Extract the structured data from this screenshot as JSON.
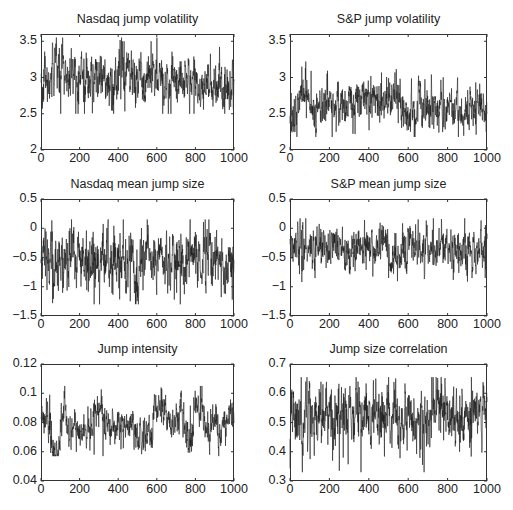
{
  "chart_data": [
    {
      "type": "line",
      "title": "Nasdaq jump volatility",
      "xlabel": "",
      "ylabel": "",
      "xlim": [
        0,
        1000
      ],
      "ylim": [
        2,
        3.6
      ],
      "xticks": [
        0,
        200,
        400,
        600,
        800,
        1000
      ],
      "yticks": [
        2,
        2.5,
        3,
        3.5
      ],
      "ytick_labels": [
        "2",
        "2.5",
        "3",
        "3.5"
      ],
      "grid": false,
      "series": [
        {
          "name": "Nasdaq jump volatility",
          "n": 1000,
          "mean": 2.97,
          "spread": 0.14,
          "min": 2.5,
          "max": 3.55,
          "segments": [
            [
              0,
              50,
              2.9
            ],
            [
              50,
              120,
              3.12
            ],
            [
              120,
              400,
              2.98
            ],
            [
              400,
              460,
              3.1
            ],
            [
              460,
              740,
              2.95
            ],
            [
              740,
              800,
              3.05
            ],
            [
              800,
              1000,
              2.9
            ]
          ],
          "peaks": [
            [
              80,
              3.55
            ],
            [
              410,
              3.5
            ],
            [
              430,
              3.5
            ],
            [
              570,
              3.5
            ],
            [
              630,
              2.5
            ],
            [
              60,
              3.48
            ]
          ]
        }
      ],
      "box": {
        "x": 41,
        "y": 34,
        "w": 193,
        "h": 116
      }
    },
    {
      "type": "line",
      "title": "S&P jump volatility",
      "xlabel": "",
      "ylabel": "",
      "xlim": [
        0,
        1000
      ],
      "ylim": [
        2,
        3.6
      ],
      "xticks": [
        0,
        200,
        400,
        600,
        800,
        1000
      ],
      "yticks": [
        2,
        2.5,
        3,
        3.5
      ],
      "ytick_labels": [
        "2",
        "2.5",
        "3",
        "3.5"
      ],
      "grid": false,
      "series": [
        {
          "name": "S&P jump volatility",
          "n": 1000,
          "mean": 2.62,
          "spread": 0.12,
          "min": 2.18,
          "max": 3.22,
          "segments": [
            [
              0,
              50,
              2.55
            ],
            [
              50,
              100,
              2.78
            ],
            [
              100,
              330,
              2.62
            ],
            [
              330,
              560,
              2.7
            ],
            [
              560,
              650,
              2.5
            ],
            [
              650,
              700,
              2.68
            ],
            [
              700,
              1000,
              2.57
            ]
          ],
          "peaks": [
            [
              80,
              3.22
            ],
            [
              60,
              3.15
            ],
            [
              330,
              2.22
            ],
            [
              630,
              2.18
            ],
            [
              850,
              3.0
            ],
            [
              410,
              3.02
            ]
          ]
        }
      ],
      "box": {
        "x": 290,
        "y": 34,
        "w": 197,
        "h": 116
      }
    },
    {
      "type": "line",
      "title": "Nasdaq mean jump size",
      "xlabel": "",
      "ylabel": "",
      "xlim": [
        0,
        1000
      ],
      "ylim": [
        -1.5,
        0.5
      ],
      "xticks": [
        0,
        200,
        400,
        600,
        800,
        1000
      ],
      "yticks": [
        -1.5,
        -1,
        -0.5,
        0,
        0.5
      ],
      "ytick_labels": [
        "−1.5",
        "−1",
        "−0.5",
        "0",
        "0.5"
      ],
      "grid": false,
      "series": [
        {
          "name": "Nasdaq mean jump size",
          "n": 1000,
          "mean": -0.55,
          "spread": 0.2,
          "min": -1.3,
          "max": 0.15,
          "segments": [
            [
              0,
              480,
              -0.55
            ],
            [
              480,
              540,
              -0.75
            ],
            [
              540,
              600,
              -0.45
            ],
            [
              600,
              840,
              -0.55
            ],
            [
              840,
              880,
              -0.35
            ],
            [
              880,
              1000,
              -0.6
            ]
          ],
          "peaks": [
            [
              60,
              -1.28
            ],
            [
              170,
              -1.2
            ],
            [
              500,
              -1.18
            ],
            [
              690,
              -1.22
            ],
            [
              850,
              0.15
            ],
            [
              990,
              -1.22
            ],
            [
              150,
              0.0
            ],
            [
              170,
              0.02
            ]
          ]
        }
      ],
      "box": {
        "x": 41,
        "y": 199,
        "w": 193,
        "h": 117
      }
    },
    {
      "type": "line",
      "title": "S&P mean jump size",
      "xlabel": "",
      "ylabel": "",
      "xlim": [
        0,
        1000
      ],
      "ylim": [
        -1.5,
        0.5
      ],
      "xticks": [
        0,
        200,
        400,
        600,
        800,
        1000
      ],
      "yticks": [
        -1.5,
        -1,
        -0.5,
        0,
        0.5
      ],
      "ytick_labels": [
        "−1.5",
        "−1",
        "−0.5",
        "0",
        "0.5"
      ],
      "grid": false,
      "series": [
        {
          "name": "S&P mean jump size",
          "n": 1000,
          "mean": -0.33,
          "spread": 0.15,
          "min": -0.92,
          "max": 0.17,
          "segments": [
            [
              0,
              480,
              -0.33
            ],
            [
              480,
              560,
              -0.5
            ],
            [
              560,
              1000,
              -0.32
            ]
          ],
          "peaks": [
            [
              60,
              -0.92
            ],
            [
              80,
              0.17
            ],
            [
              650,
              0.15
            ],
            [
              500,
              -0.85
            ],
            [
              990,
              -0.85
            ]
          ]
        }
      ],
      "box": {
        "x": 290,
        "y": 199,
        "w": 197,
        "h": 117
      }
    },
    {
      "type": "line",
      "title": "Jump intensity",
      "xlabel": "",
      "ylabel": "",
      "xlim": [
        0,
        1000
      ],
      "ylim": [
        0.04,
        0.12
      ],
      "xticks": [
        0,
        200,
        400,
        600,
        800,
        1000
      ],
      "yticks": [
        0.04,
        0.06,
        0.08,
        0.1,
        0.12
      ],
      "ytick_labels": [
        "0.04",
        "0.06",
        "0.08",
        "0.1",
        "0.12"
      ],
      "grid": false,
      "series": [
        {
          "name": "Jump intensity",
          "n": 1000,
          "mean": 0.079,
          "spread": 0.005,
          "min": 0.057,
          "max": 0.105,
          "segments": [
            [
              0,
              50,
              0.083
            ],
            [
              50,
              100,
              0.063
            ],
            [
              100,
              130,
              0.088
            ],
            [
              130,
              270,
              0.075
            ],
            [
              270,
              320,
              0.088
            ],
            [
              320,
              480,
              0.078
            ],
            [
              480,
              560,
              0.07
            ],
            [
              560,
              580,
              0.068
            ],
            [
              580,
              640,
              0.09
            ],
            [
              640,
              700,
              0.08
            ],
            [
              700,
              740,
              0.089
            ],
            [
              740,
              790,
              0.07
            ],
            [
              790,
              840,
              0.09
            ],
            [
              840,
              950,
              0.078
            ],
            [
              950,
              1000,
              0.085
            ]
          ],
          "peaks": [
            [
              45,
              0.099
            ],
            [
              85,
              0.057
            ],
            [
              275,
              0.058
            ],
            [
              625,
              0.103
            ],
            [
              825,
              0.105
            ],
            [
              520,
              0.059
            ]
          ]
        }
      ],
      "box": {
        "x": 41,
        "y": 364,
        "w": 193,
        "h": 117
      }
    },
    {
      "type": "line",
      "title": "Jump size correlation",
      "xlabel": "",
      "ylabel": "",
      "xlim": [
        0,
        1000
      ],
      "ylim": [
        0.3,
        0.7
      ],
      "xticks": [
        0,
        200,
        400,
        600,
        800,
        1000
      ],
      "yticks": [
        0.3,
        0.4,
        0.5,
        0.6,
        0.7
      ],
      "ytick_labels": [
        "0.3",
        "0.4",
        "0.5",
        "0.6",
        "0.7"
      ],
      "grid": false,
      "series": [
        {
          "name": "Jump size correlation",
          "n": 1000,
          "mean": 0.52,
          "spread": 0.045,
          "min": 0.33,
          "max": 0.655,
          "segments": [
            [
              0,
              1000,
              0.52
            ]
          ],
          "peaks": [
            [
              250,
              0.335
            ],
            [
              360,
              0.33
            ],
            [
              270,
              0.38
            ],
            [
              920,
              0.655
            ],
            [
              435,
              0.65
            ],
            [
              80,
              0.64
            ],
            [
              345,
              0.64
            ],
            [
              860,
              0.4
            ]
          ]
        }
      ],
      "box": {
        "x": 290,
        "y": 364,
        "w": 197,
        "h": 117
      }
    }
  ]
}
